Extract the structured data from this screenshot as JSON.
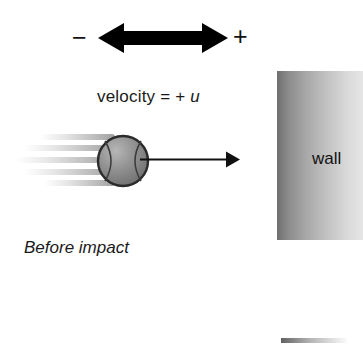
{
  "figure": {
    "background_color": "#ffffff",
    "caption": "Before impact"
  },
  "sign_axis": {
    "negative_label": "−",
    "positive_label": "+",
    "arrow_name": "double-headed-direction-arrow",
    "arrow_color": "#000000",
    "meaning": "positive direction points right, toward the wall"
  },
  "velocity": {
    "label_prefix": "velocity = + ",
    "symbol": "u",
    "vector_direction": "right",
    "vector_color": "#111111"
  },
  "ball": {
    "name": "ball",
    "fill_color": "#8a8a8a",
    "outline_color": "#2b2b2b",
    "moving": true,
    "trail_count": 5
  },
  "wall": {
    "label": "wall",
    "gradient_dark": "#6f6f6f",
    "gradient_light": "#e6e6e6",
    "text_color": "#111111"
  }
}
